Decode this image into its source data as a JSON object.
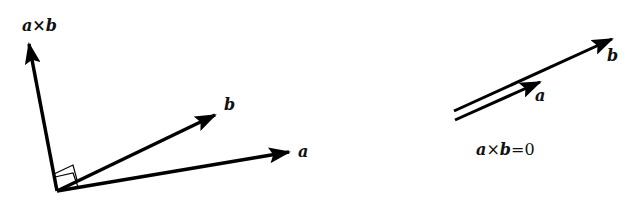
{
  "left_figure": {
    "labels": {
      "cross": "a×b",
      "b": "b",
      "a": "a"
    }
  },
  "right_figure": {
    "labels": {
      "b": "b",
      "a": "a"
    },
    "equation": {
      "lhs_a": "a",
      "times": "×",
      "lhs_b": "b",
      "rhs": "=0"
    }
  },
  "colors": {
    "stroke": "#000000",
    "background": "#ffffff"
  }
}
